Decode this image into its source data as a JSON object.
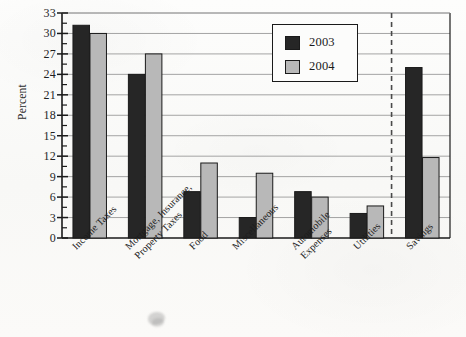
{
  "chart_data": {
    "type": "bar",
    "title": "",
    "xlabel": "",
    "ylabel": "Percent",
    "ylim": [
      0,
      33
    ],
    "ytick_step": 3,
    "yticks": [
      0,
      3,
      6,
      9,
      12,
      15,
      18,
      21,
      24,
      27,
      30,
      33
    ],
    "minor_tick_step": 1.5,
    "grid": "horizontal",
    "legend_position": "upper-right-inside",
    "categories": [
      "Income Taxes",
      "Mortgage, Insurance,\nProperty Taxes",
      "Food",
      "Miscellaneous",
      "Automobile\nExpenses",
      "Utilities",
      "Savings"
    ],
    "series": [
      {
        "name": "2003",
        "color": "#262626",
        "values": [
          31.2,
          24.0,
          6.8,
          3.0,
          6.8,
          3.6,
          25.0
        ]
      },
      {
        "name": "2004",
        "color": "#b8b8b8",
        "values": [
          30.0,
          27.0,
          11.0,
          9.5,
          6.0,
          4.7,
          11.8
        ]
      }
    ],
    "annotations": [
      {
        "type": "vertical-dashed-separator",
        "after_category": "Utilities"
      }
    ]
  },
  "axis": {
    "y_title": "Percent",
    "tick_labels": [
      "33",
      "30",
      "27",
      "24",
      "21",
      "18",
      "15",
      "12",
      "9",
      "6",
      "3",
      "0"
    ]
  },
  "legend": {
    "entries": [
      {
        "label": "2003",
        "swatch": "dark"
      },
      {
        "label": "2004",
        "swatch": "light"
      }
    ]
  },
  "watermark": {
    "text": "",
    "visible": true
  },
  "colors": {
    "series_2003": "#262626",
    "series_2004": "#b8b8b8",
    "axis": "#1a1a1a",
    "grid": "#9a9a9a",
    "background": "#fbfbfa"
  }
}
